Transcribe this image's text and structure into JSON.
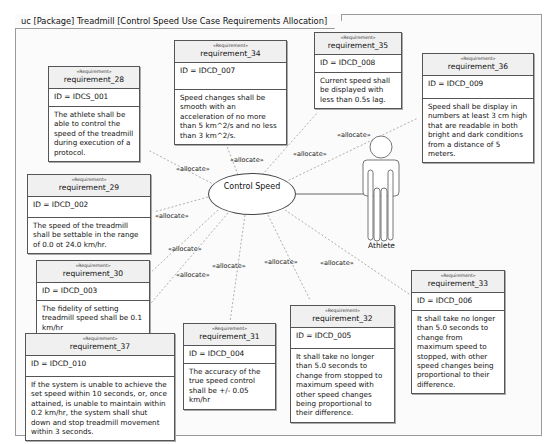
{
  "frame": {
    "title": "uc [Package] Treadmill [Control Speed Use Case Requirements Allocation]"
  },
  "use_case": {
    "name": "Control Speed"
  },
  "actor": {
    "name": "Athlete"
  },
  "relation_label": "«allocate»",
  "stereotype": "«Requirement»",
  "requirements": [
    {
      "name": "requirement_28",
      "id": "ID = IDCS_001",
      "text": "The athlete shall be able to control the speed of the treadmill during execution of a protocol."
    },
    {
      "name": "requirement_34",
      "id": "ID = IDCD_007",
      "text": "Speed changes shall be smooth with an acceleration of no more than 5 km^2/s and no less than 3 km^2/s."
    },
    {
      "name": "requirement_35",
      "id": "ID = IDCD_008",
      "text": "Current speed shall be displayed with less than 0.5s lag."
    },
    {
      "name": "requirement_36",
      "id": "ID = IDCD_009",
      "text": "Speed shall be display in numbers at least 3 cm high that are readable in both bright and dark conditions from a distance of 5 meters."
    },
    {
      "name": "requirement_29",
      "id": "ID = IDCD_002",
      "text": "The speed of the treadmill shall be settable in the range of 0.0 ot 24.0 km/hr."
    },
    {
      "name": "requirement_30",
      "id": "ID = IDCD_003",
      "text": "The fidelity of setting treadmill speed shall be 0.1 km/hr"
    },
    {
      "name": "requirement_37",
      "id": "ID = IDCD_010",
      "text": "If the system is unable to achieve the set speed within 10 seconds, or, once attained, is unable to maintain within 0.2 km/hr, the system shall shut down and stop treadmill movement within 3 seconds."
    },
    {
      "name": "requirement_31",
      "id": "ID = IDCD_004",
      "text": "The accuracy of the true speed control shall be +/- 0.05 km/hr"
    },
    {
      "name": "requirement_32",
      "id": "ID = IDCD_005",
      "text": "It shall take no longer than 5.0 seconds to change from stopped to maximum speed with other speed changes being proportional to their difference."
    },
    {
      "name": "requirement_33",
      "id": "ID = IDCD_006",
      "text": "It shall take no longer than 5.0 seconds to change from maximum speed to stopped, with other speed changes being proportional to their difference."
    }
  ],
  "colors": {
    "frame_border": "#9a9a9a",
    "box_border": "#555555",
    "header_fill": "#f0f0f0",
    "dependency_line": "#9a9a9a"
  }
}
